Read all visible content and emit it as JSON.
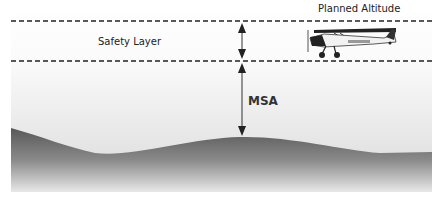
{
  "diagram": {
    "labels": {
      "planned_altitude": "Planned Altitude",
      "safety_layer": "Safety Layer",
      "msa": "MSA"
    },
    "aircraft": {
      "registration": "G-AWFZ",
      "type": "high-wing light aircraft"
    },
    "lines": {
      "planned_altitude_y": 21,
      "msa_y": 61,
      "style": "dashed"
    },
    "colors": {
      "dashed_line": "#222222",
      "arrow": "#222222",
      "sky_top": "#ffffff",
      "sky_bottom": "#dcdcdc",
      "terrain_top": "#5a5a5a",
      "terrain_bottom": "#e6e6e6"
    }
  }
}
